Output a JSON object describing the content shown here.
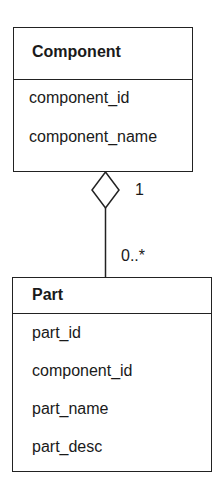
{
  "classes": [
    {
      "name": "Component",
      "attributes": [
        "component_id",
        "component_name"
      ]
    },
    {
      "name": "Part",
      "attributes": [
        "part_id",
        "component_id",
        "part_name",
        "part_desc"
      ]
    }
  ],
  "association": {
    "type": "aggregation",
    "whole_multiplicity": "1",
    "part_multiplicity": "0..*"
  }
}
